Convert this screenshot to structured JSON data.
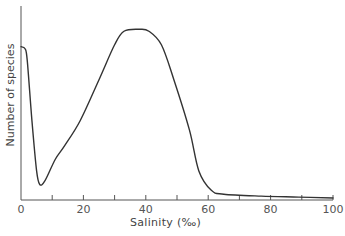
{
  "chart_data": {
    "type": "line",
    "title": "",
    "xlabel": "Salinity (‰)",
    "ylabel": "Number of species",
    "xlim": [
      0,
      100
    ],
    "ylim": [
      0,
      100
    ],
    "xticks": [
      0,
      20,
      40,
      60,
      80,
      100
    ],
    "minor_xticks": [
      10,
      30,
      50,
      70,
      90
    ],
    "yticks": [],
    "grid": false,
    "legend": null,
    "series": [
      {
        "name": "Number of species",
        "x": [
          0,
          1.3,
          2,
          3.5,
          5,
          6,
          7.7,
          11,
          14,
          19,
          25,
          30,
          33,
          38,
          41,
          45,
          49,
          54,
          57,
          61,
          65,
          77,
          89,
          100
        ],
        "y": [
          79,
          78,
          72,
          41,
          15,
          8,
          10,
          21,
          28,
          41,
          62,
          80,
          87,
          88,
          87,
          80,
          62,
          36,
          15,
          5,
          3,
          2,
          1.5,
          1
        ]
      }
    ]
  },
  "labels": {
    "ylabel": "Number of species",
    "xlabel": "Salinity (‰)",
    "ticks": [
      "0",
      "20",
      "40",
      "60",
      "80",
      "100"
    ]
  }
}
